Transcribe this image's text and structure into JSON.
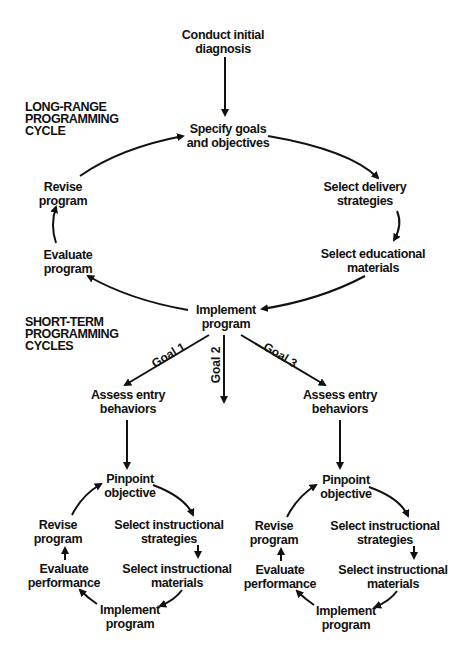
{
  "diagram": {
    "sections": {
      "long_range": "LONG-RANGE\nPROGRAMMING\nCYCLE",
      "short_term": "SHORT-TERM\nPROGRAMMING\nCYCLES"
    },
    "long_range_cycle": {
      "start": "Conduct initial\ndiagnosis",
      "specify": "Specify goals\nand objectives",
      "delivery": "Select delivery\nstrategies",
      "materials": "Select educational\nmaterials",
      "implement": "Implement\nprogram",
      "evaluate": "Evaluate\nprogram",
      "revise": "Revise\nprogram"
    },
    "goals": [
      "Goal 1",
      "Goal 2",
      "Goal 3"
    ],
    "short_term_cycles": [
      {
        "entry": "Assess entry\nbehaviors",
        "pinpoint": "Pinpoint\nobjective",
        "strategies": "Select instructional\nstrategies",
        "materials": "Select instructional\nmaterials",
        "implement": "Implement\nprogram",
        "evaluate": "Evaluate\nperformance",
        "revise": "Revise\nprogram"
      },
      {
        "entry": "Assess entry\nbehaviors",
        "pinpoint": "Pinpoint\nobjective",
        "strategies": "Select instructional\nstrategies",
        "materials": "Select instructional\nmaterials",
        "implement": "Implement\nprogram",
        "evaluate": "Evaluate\nperformance",
        "revise": "Revise\nprogram"
      }
    ]
  }
}
